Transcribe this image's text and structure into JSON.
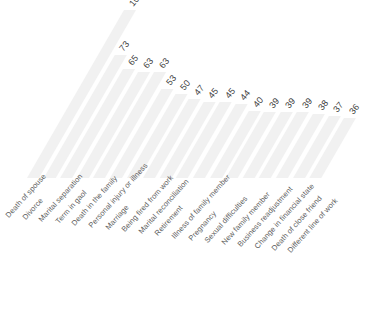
{
  "chart_data": {
    "type": "bar",
    "title": "",
    "xlabel": "",
    "ylabel": "",
    "ylim": [
      0,
      100
    ],
    "grid": false,
    "legend": false,
    "orientation": "vertical-skewed",
    "categories": [
      "Death of spouse",
      "Divorce",
      "Marital separation",
      "Term in gaol",
      "Death in the family",
      "Personal injury or illness",
      "Marriage",
      "Being fired from work",
      "Marital reconciliation",
      "Retirement",
      "Illness of family member",
      "Pregnancy",
      "Sexual difficulties",
      "New family member",
      "Business readjustment",
      "Change in financial state",
      "Death of close friend",
      "Different line of work"
    ],
    "values": [
      100,
      73,
      65,
      63,
      63,
      53,
      50,
      47,
      45,
      45,
      44,
      40,
      39,
      39,
      39,
      38,
      37,
      36
    ],
    "value_labels": [
      "100",
      "73",
      "65",
      "63",
      "63",
      "53",
      "50",
      "47",
      "45",
      "45",
      "44",
      "40",
      "39",
      "39",
      "39",
      "38",
      "37",
      "36"
    ],
    "bar_color": "#f1f1f1",
    "label_color": "#3c3c3c",
    "category_label_color": "#5a5a5a"
  }
}
